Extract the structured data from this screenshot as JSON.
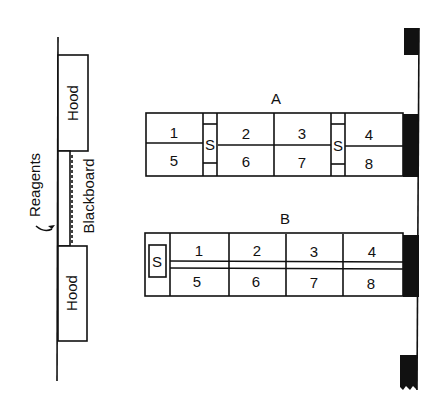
{
  "diagram": {
    "type": "lab floor plan",
    "left_wall": {
      "hood_top_label": "Hood",
      "hood_bottom_label": "Hood",
      "reagents_label": "Reagents",
      "blackboard_label": "Blackboard"
    },
    "bench_a": {
      "label": "A",
      "top_row": [
        "1",
        "2",
        "3",
        "4"
      ],
      "bottom_row": [
        "5",
        "6",
        "7",
        "8"
      ],
      "sinks": [
        "S",
        "S"
      ]
    },
    "bench_b": {
      "label": "B",
      "top_row": [
        "1",
        "2",
        "3",
        "4"
      ],
      "bottom_row": [
        "5",
        "6",
        "7",
        "8"
      ],
      "sink": "S"
    }
  }
}
